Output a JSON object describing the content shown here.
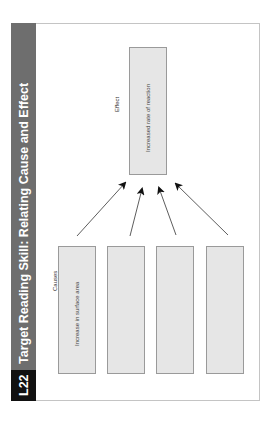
{
  "header": {
    "lesson_code": "L22",
    "title": "Target Reading Skill: Relating Cause and Effect"
  },
  "diagram": {
    "effect_label": "Effect",
    "effect_box": {
      "text": "Increased rate of reaction"
    },
    "causes_label": "Causes",
    "cause_boxes": [
      {
        "text": "Increase in surface area"
      },
      {
        "text": ""
      },
      {
        "text": ""
      },
      {
        "text": ""
      }
    ],
    "arrow_count": 4
  },
  "colors": {
    "header_band": "#6e6e6e",
    "lesson_band": "#111111",
    "box_fill": "#e6e6e6",
    "box_border": "#9a9a9a"
  },
  "orientation": "rotated 90° counter-clockwise"
}
